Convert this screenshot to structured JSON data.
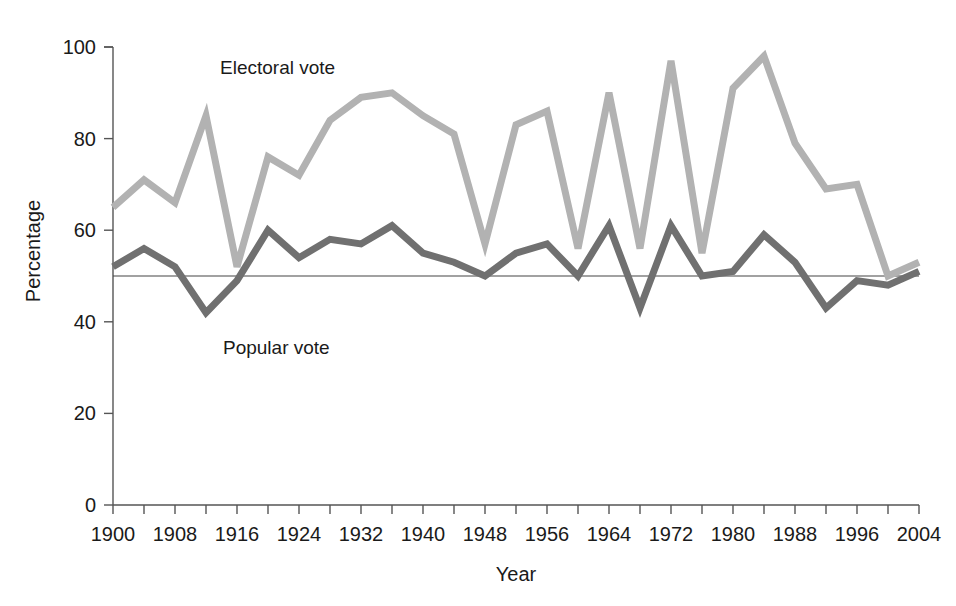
{
  "chart_data": {
    "type": "line",
    "title": "",
    "xlabel": "Year",
    "ylabel": "Percentage",
    "xlim": [
      1900,
      2004
    ],
    "ylim": [
      0,
      100
    ],
    "grid": false,
    "legend_position": "inline-annotations",
    "x_tick_step_minor": 4,
    "x_tick_step_major": 8,
    "y_tick_labels": [
      "0",
      "20",
      "40",
      "60",
      "80",
      "100"
    ],
    "y_tick_values": [
      0,
      20,
      40,
      60,
      80,
      100
    ],
    "x_tick_labels": [
      "1900",
      "1908",
      "1916",
      "1924",
      "1932",
      "1940",
      "1948",
      "1956",
      "1964",
      "1972",
      "1980",
      "1988",
      "1996",
      "2004"
    ],
    "x_tick_values": [
      1900,
      1908,
      1916,
      1924,
      1932,
      1940,
      1948,
      1956,
      1964,
      1972,
      1980,
      1988,
      1996,
      2004
    ],
    "reference_line": {
      "value": 50,
      "label": ""
    },
    "x": [
      1900,
      1904,
      1908,
      1912,
      1916,
      1920,
      1924,
      1928,
      1932,
      1936,
      1940,
      1944,
      1948,
      1952,
      1956,
      1960,
      1964,
      1968,
      1972,
      1976,
      1980,
      1984,
      1988,
      1992,
      1996,
      2000,
      2004
    ],
    "series": [
      {
        "name": "Electoral vote",
        "color": "#b2b2b2",
        "values": [
          65,
          71,
          66,
          85,
          52,
          76,
          72,
          84,
          89,
          90,
          85,
          81,
          57,
          83,
          86,
          56,
          90,
          56,
          97,
          55,
          91,
          98,
          79,
          69,
          70,
          50,
          53
        ],
        "label_x": 1916,
        "label_y": 94
      },
      {
        "name": "Popular vote",
        "color": "#707070",
        "values": [
          52,
          56,
          52,
          42,
          49,
          60,
          54,
          58,
          57,
          61,
          55,
          53,
          50,
          55,
          57,
          50,
          61,
          43,
          61,
          50,
          51,
          59,
          53,
          43,
          49,
          48,
          51
        ],
        "label_x": 1916,
        "label_y": 33
      }
    ]
  }
}
